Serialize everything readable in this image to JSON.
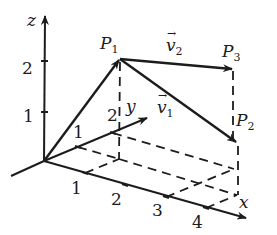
{
  "diagram": {
    "axes": {
      "x": {
        "label": "x",
        "ticks": [
          "1",
          "2",
          "3",
          "4"
        ]
      },
      "y": {
        "label": "y",
        "ticks": [
          "1",
          "2"
        ]
      },
      "z": {
        "label": "z",
        "ticks": [
          "1",
          "2"
        ]
      }
    },
    "points": {
      "P1": {
        "name": "P",
        "sub": "1"
      },
      "P2": {
        "name": "P",
        "sub": "2"
      },
      "P3": {
        "name": "P",
        "sub": "3"
      }
    },
    "vectors": {
      "v1": {
        "name": "v",
        "sub": "1",
        "arrow": "→"
      },
      "v2": {
        "name": "v",
        "sub": "2",
        "arrow": "→"
      }
    },
    "colors": {
      "ink": "#1c1c1c",
      "background": "#ffffff"
    }
  }
}
